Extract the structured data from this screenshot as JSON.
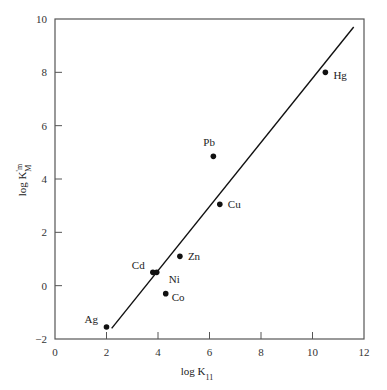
{
  "chart_data": {
    "type": "scatter",
    "title": "",
    "xlabel": "log K11",
    "ylabel": "log K'm M",
    "xlim": [
      0,
      12
    ],
    "ylim": [
      -2,
      10
    ],
    "xticks": [
      0,
      2,
      4,
      6,
      8,
      10,
      12
    ],
    "yticks": [
      -2,
      0,
      2,
      4,
      6,
      8,
      10
    ],
    "grid": false,
    "legend": null,
    "points": [
      {
        "label": "Ag",
        "x": 2.0,
        "y": -1.55
      },
      {
        "label": "Cd",
        "x": 3.8,
        "y": 0.5
      },
      {
        "label": "Ni",
        "x": 3.95,
        "y": 0.5
      },
      {
        "label": "Zn",
        "x": 4.85,
        "y": 1.1
      },
      {
        "label": "Co",
        "x": 4.3,
        "y": -0.3
      },
      {
        "label": "Cu",
        "x": 6.4,
        "y": 3.05
      },
      {
        "label": "Pb",
        "x": 6.15,
        "y": 4.85
      },
      {
        "label": "Hg",
        "x": 10.5,
        "y": 8.0
      }
    ],
    "fit_line": {
      "x": [
        2.2,
        11.6
      ],
      "y": [
        -1.6,
        9.7
      ]
    }
  },
  "axes": {
    "xlabel_main": "log K",
    "xlabel_sub": "11",
    "ylabel_main": "log K",
    "ylabel_sup": "'m",
    "ylabel_sub": "M"
  }
}
